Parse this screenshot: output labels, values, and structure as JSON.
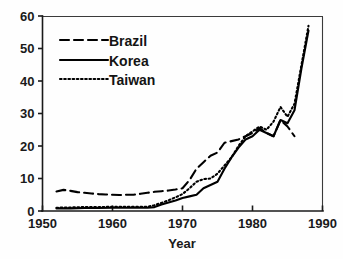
{
  "chart_data": {
    "type": "line",
    "title": "",
    "xlabel": "Year",
    "ylabel": "",
    "xlim": [
      1950,
      1990
    ],
    "ylim": [
      0,
      60
    ],
    "grid": false,
    "legend_position": "upper-left",
    "x_ticks": [
      "1950",
      "1960",
      "1970",
      "1980",
      "1990"
    ],
    "x_tick_values": [
      1950,
      1960,
      1970,
      1980,
      1990
    ],
    "y_ticks": [
      "0",
      "10",
      "20",
      "30",
      "40",
      "50",
      "60"
    ],
    "y_tick_values": [
      0,
      10,
      20,
      30,
      40,
      50,
      60
    ],
    "series": [
      {
        "name": "Brazil",
        "line_style": "dashed",
        "color": "#000000",
        "x": [
          1952,
          1953,
          1954,
          1955,
          1956,
          1957,
          1958,
          1959,
          1960,
          1961,
          1962,
          1963,
          1964,
          1965,
          1966,
          1967,
          1968,
          1969,
          1970,
          1971,
          1972,
          1973,
          1974,
          1975,
          1976,
          1977,
          1978,
          1979,
          1980,
          1981,
          1982,
          1983,
          1984,
          1985,
          1986
        ],
        "values": [
          6.0,
          6.5,
          6.2,
          5.8,
          5.6,
          5.4,
          5.2,
          5.1,
          5.0,
          4.9,
          5.0,
          5.0,
          5.3,
          5.6,
          5.9,
          6.1,
          6.3,
          6.6,
          7.0,
          9.5,
          13.0,
          15.0,
          17.0,
          18.0,
          21.0,
          21.5,
          22.0,
          23.0,
          24.0,
          25.5,
          24.0,
          23.0,
          28.0,
          26.0,
          23.0
        ]
      },
      {
        "name": "Korea",
        "line_style": "solid",
        "color": "#000000",
        "x": [
          1952,
          1954,
          1956,
          1958,
          1960,
          1962,
          1964,
          1965,
          1966,
          1967,
          1968,
          1969,
          1970,
          1971,
          1972,
          1973,
          1974,
          1975,
          1976,
          1977,
          1978,
          1979,
          1980,
          1981,
          1982,
          1983,
          1984,
          1985,
          1986,
          1987,
          1988
        ],
        "values": [
          0.8,
          0.8,
          0.9,
          0.9,
          1.0,
          1.0,
          1.0,
          1.0,
          1.2,
          2.0,
          2.6,
          3.2,
          4.0,
          4.5,
          5.0,
          7.0,
          8.0,
          9.0,
          13.0,
          16.5,
          19.5,
          22.0,
          23.0,
          25.0,
          24.0,
          23.0,
          28.0,
          27.0,
          31.0,
          44.0,
          55.5
        ]
      },
      {
        "name": "Taiwan",
        "line_style": "dotted",
        "color": "#000000",
        "x": [
          1952,
          1954,
          1956,
          1958,
          1960,
          1962,
          1964,
          1965,
          1966,
          1967,
          1968,
          1969,
          1970,
          1971,
          1972,
          1973,
          1974,
          1975,
          1976,
          1977,
          1978,
          1979,
          1980,
          1981,
          1982,
          1983,
          1984,
          1985,
          1986,
          1987,
          1988
        ],
        "values": [
          1.0,
          1.1,
          1.2,
          1.2,
          1.3,
          1.3,
          1.3,
          1.3,
          1.8,
          2.5,
          3.3,
          4.2,
          5.2,
          7.0,
          9.0,
          9.8,
          10.0,
          11.5,
          14.0,
          16.5,
          20.0,
          23.0,
          24.5,
          26.0,
          25.0,
          27.5,
          32.0,
          29.0,
          33.0,
          45.0,
          57.0
        ]
      }
    ]
  },
  "legend": {
    "entries": [
      {
        "label": "Brazil",
        "style": "dashed"
      },
      {
        "label": "Korea",
        "style": "solid"
      },
      {
        "label": "Taiwan",
        "style": "dotted"
      }
    ]
  }
}
